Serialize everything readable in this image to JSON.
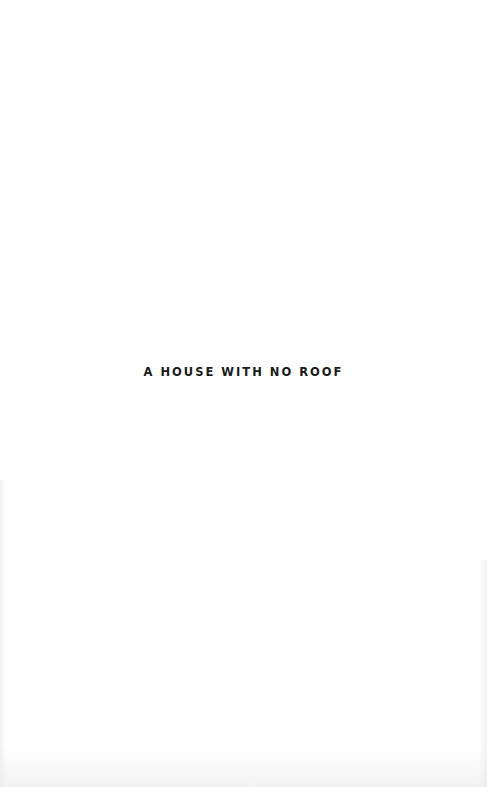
{
  "page": {
    "type": "half-title",
    "title": "A HOUSE WITH NO ROOF",
    "background_color": "#ffffff",
    "text_color": "#1a1a1a"
  }
}
